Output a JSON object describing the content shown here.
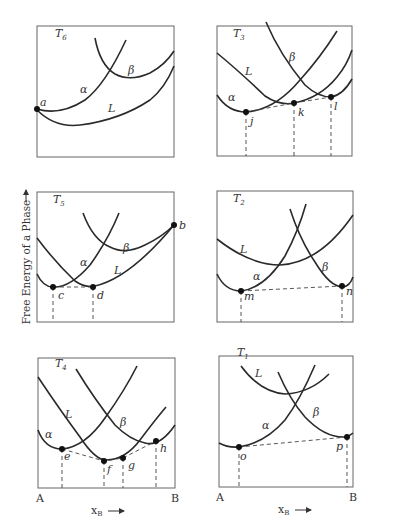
{
  "figure": {
    "y_axis_label": "Free Energy of a Phase",
    "y_axis_arrow": "→",
    "panels": [
      {
        "id": "T6",
        "temp_label": "T",
        "temp_sub": "6",
        "phase_labels": {
          "alpha": "α",
          "beta": "β",
          "liquid": "L"
        },
        "points": [
          "a"
        ]
      },
      {
        "id": "T3",
        "temp_label": "T",
        "temp_sub": "3",
        "phase_labels": {
          "alpha": "α",
          "beta": "β",
          "liquid": "L"
        },
        "points": [
          "j",
          "k",
          "l"
        ]
      },
      {
        "id": "T5",
        "temp_label": "T",
        "temp_sub": "5",
        "phase_labels": {
          "alpha": "α",
          "beta": "β",
          "liquid": "L"
        },
        "points": [
          "c",
          "d",
          "b"
        ]
      },
      {
        "id": "T2",
        "temp_label": "T",
        "temp_sub": "2",
        "phase_labels": {
          "alpha": "α",
          "beta": "β",
          "liquid": "L"
        },
        "points": [
          "m",
          "n"
        ]
      },
      {
        "id": "T4",
        "temp_label": "T",
        "temp_sub": "4",
        "phase_labels": {
          "alpha": "α",
          "beta": "β",
          "liquid": "L"
        },
        "points": [
          "e",
          "f",
          "g",
          "h"
        ]
      },
      {
        "id": "T1",
        "temp_label": "T",
        "temp_sub": "1",
        "phase_labels": {
          "alpha": "α",
          "beta": "β",
          "liquid": "L"
        },
        "points": [
          "o",
          "p"
        ]
      }
    ],
    "x_axis": {
      "left_label": "A",
      "right_label": "B",
      "var_label": "x",
      "var_sub": "B",
      "arrow": "⟶"
    }
  }
}
